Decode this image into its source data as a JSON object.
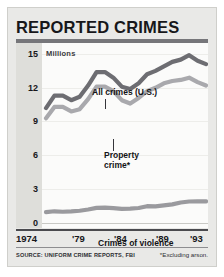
{
  "title": "REPORTED CRIMES",
  "units_caption": "Millions",
  "footer": {
    "source": "SOURCE: UNIFORM CRIME REPORTS, FBI",
    "note": "*Excluding arson."
  },
  "annotations": {
    "all_crimes": "All crimes (U.S.)",
    "property_crime": "Property\ncrime*",
    "property_crime_line1": "Property",
    "property_crime_line2": "crime*",
    "crimes_of_violence": "Crimes of violence"
  },
  "colors": {
    "all_crimes": "#6d6d72",
    "property_crime": "#a9a9ad",
    "crimes_of_violence": "#9a9a9e",
    "title": "#17171a",
    "rule": "#76767a",
    "card_background": "#e9e9e7",
    "plot_background": "#fbfbfa",
    "axis_strip": "#dededa"
  },
  "chart_data": {
    "type": "line",
    "title": "REPORTED CRIMES",
    "subtitle": "",
    "xlabel": "",
    "ylabel": "Millions",
    "ylim": [
      0,
      15
    ],
    "xlim": [
      1974,
      1993
    ],
    "yticks": [
      0,
      3,
      6,
      9,
      12,
      15
    ],
    "ytick_labels": [
      "0",
      "3",
      "6",
      "9",
      "12",
      "15"
    ],
    "xticks": [
      1974,
      1979,
      1984,
      1989,
      1993
    ],
    "xtick_labels": [
      "1974",
      "'79",
      "'84",
      "'89",
      "'93"
    ],
    "grid": true,
    "legend": "inline-annotations",
    "x": [
      1974,
      1975,
      1976,
      1977,
      1978,
      1979,
      1980,
      1981,
      1982,
      1983,
      1984,
      1985,
      1986,
      1987,
      1988,
      1989,
      1990,
      1991,
      1992,
      1993
    ],
    "series": [
      {
        "name": "All crimes (U.S.)",
        "color": "#6d6d72",
        "values": [
          10.2,
          11.3,
          11.3,
          10.9,
          11.2,
          12.2,
          13.4,
          13.4,
          12.9,
          12.1,
          11.9,
          12.4,
          13.2,
          13.5,
          13.9,
          14.3,
          14.5,
          14.9,
          14.4,
          14.1
        ]
      },
      {
        "name": "Property crime*",
        "color": "#a9a9ad",
        "values": [
          9.3,
          10.3,
          10.3,
          9.9,
          10.1,
          11.0,
          12.1,
          12.1,
          11.7,
          10.9,
          10.6,
          11.1,
          11.7,
          12.0,
          12.4,
          12.6,
          12.7,
          12.9,
          12.5,
          12.2
        ]
      },
      {
        "name": "Crimes of violence",
        "color": "#9a9a9e",
        "values": [
          0.97,
          1.04,
          1.0,
          1.03,
          1.09,
          1.2,
          1.34,
          1.36,
          1.32,
          1.26,
          1.27,
          1.33,
          1.49,
          1.48,
          1.57,
          1.65,
          1.82,
          1.91,
          1.93,
          1.92
        ]
      }
    ]
  }
}
